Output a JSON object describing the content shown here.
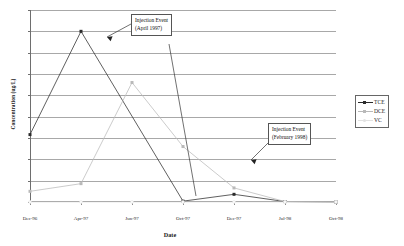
{
  "chart_data": {
    "type": "line",
    "title": "",
    "xlabel": "Date",
    "ylabel": "Concentration (ug/L)",
    "categories": [
      "Dec-96",
      "Apr-97",
      "Jun-97",
      "Oct-97",
      "Dec-97",
      "Jul-98",
      "Oct-98"
    ],
    "x_positions": [
      0,
      17.5,
      35,
      52.5,
      70,
      87.5,
      105
    ],
    "ylim": [
      0,
      4500
    ],
    "yticks": [
      0,
      500,
      1000,
      1500,
      2000,
      2500,
      3000,
      3500,
      4000,
      4500
    ],
    "ytick_labels": [
      "0",
      "500",
      "1000",
      "1500",
      "2000",
      "2500",
      "3000",
      "3500",
      "4000",
      "4500"
    ],
    "grid": true,
    "legend_position": "right",
    "series": [
      {
        "name": "TCE",
        "color": "#2b2b2b",
        "marker": "square",
        "values": [
          1580,
          4000,
          null,
          20,
          180,
          10,
          0
        ]
      },
      {
        "name": "DCE",
        "color": "#b9b9b9",
        "marker": "square",
        "values": [
          250,
          430,
          2800,
          1300,
          330,
          10,
          0
        ]
      },
      {
        "name": "VC",
        "color": "#e2e2e2",
        "marker": "circle",
        "values": [
          0,
          0,
          0,
          0,
          0,
          0,
          0
        ]
      }
    ],
    "annotations": [
      {
        "id": "april-1997",
        "line1": "Injection Event",
        "line2": "(April 1997)",
        "target": "Apr-97 TCE peak"
      },
      {
        "id": "february-1998",
        "line1": "Injection Event",
        "line2": "(February 1998)",
        "target": "between Dec-97 and Jul-98"
      }
    ]
  },
  "legend": {
    "items": [
      {
        "label": "TCE"
      },
      {
        "label": "DCE"
      },
      {
        "label": "VC"
      }
    ]
  },
  "axes": {
    "x_title": "Date",
    "y_title": "Concentration (ug/L)"
  },
  "colors": {
    "tce": "#2b2b2b",
    "dce": "#b9b9b9",
    "vc": "#e2e2e2",
    "grid": "#a8a8a8",
    "axis": "#6e6e6e",
    "text": "#1a1a1a"
  }
}
